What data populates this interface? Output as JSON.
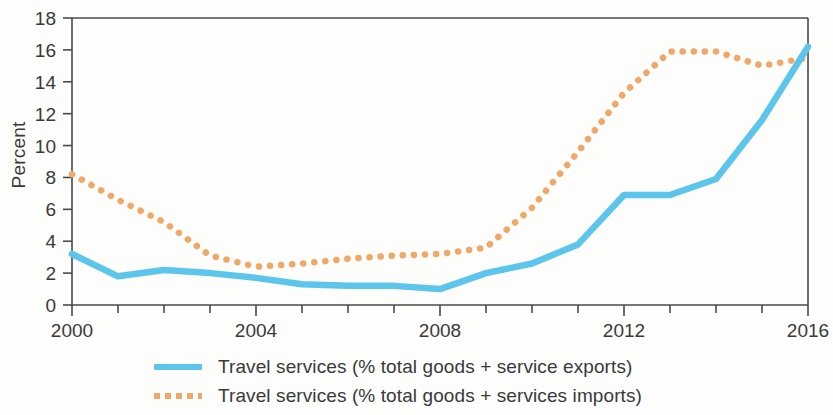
{
  "chart_data": {
    "type": "line",
    "title": "",
    "xlabel": "",
    "ylabel": "Percent",
    "xlim": [
      2000,
      2016
    ],
    "ylim": [
      0,
      18
    ],
    "ytick_step": 2,
    "yticks": [
      0,
      2,
      4,
      6,
      8,
      10,
      12,
      14,
      16,
      18
    ],
    "xticks_major": [
      2000,
      2004,
      2008,
      2012,
      2016
    ],
    "xticks_minor": [
      2001,
      2002,
      2003,
      2005,
      2006,
      2007,
      2009,
      2010,
      2011,
      2013,
      2014,
      2015
    ],
    "grid": false,
    "legend_position": "bottom",
    "x": [
      2000,
      2001,
      2002,
      2003,
      2004,
      2005,
      2006,
      2007,
      2008,
      2009,
      2010,
      2011,
      2012,
      2013,
      2014,
      2015,
      2016
    ],
    "series": [
      {
        "name": "Travel services (% total goods + service exports)",
        "style": "solid",
        "color": "#5bc5ec",
        "values": [
          3.2,
          1.8,
          2.2,
          2.0,
          1.7,
          1.3,
          1.2,
          1.2,
          1.0,
          2.0,
          2.6,
          3.8,
          6.9,
          6.9,
          7.9,
          11.6,
          16.2
        ]
      },
      {
        "name": "Travel services (% total goods + services imports)",
        "style": "dotted",
        "color": "#f0a868",
        "values": [
          8.2,
          6.6,
          5.2,
          3.1,
          2.4,
          2.6,
          2.9,
          3.1,
          3.2,
          3.6,
          6.1,
          9.6,
          13.3,
          15.9,
          15.9,
          15.0,
          15.5
        ]
      }
    ]
  },
  "axes": {
    "ylabel": "Percent",
    "ytick_labels": [
      "0",
      "2",
      "4",
      "6",
      "8",
      "10",
      "12",
      "14",
      "16",
      "18"
    ],
    "xtick_labels": [
      "2000",
      "2004",
      "2008",
      "2012",
      "2016"
    ]
  },
  "legend": {
    "items": [
      {
        "label": "Travel services (% total goods + service exports)",
        "marker": "solid-line-swatch",
        "color": "#5bc5ec"
      },
      {
        "label": "Travel services (% total goods + services imports)",
        "marker": "dotted-line-swatch",
        "color": "#f0a868"
      }
    ]
  },
  "colors": {
    "exports_line": "#5bc5ec",
    "imports_line": "#f0a868",
    "axis": "#4a4a4a",
    "text": "#3a3a3a",
    "background": "#fdfdfc"
  }
}
